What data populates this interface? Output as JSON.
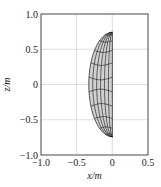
{
  "chart_data": {
    "type": "line",
    "title": "",
    "xlabel": "x/m",
    "ylabel": "z/m",
    "xlim": [
      -1.0,
      0.5
    ],
    "ylim": [
      -1.0,
      1.0
    ],
    "xticks": [
      -1.0,
      -0.5,
      0,
      0.5
    ],
    "xtick_labels": [
      "−1.0",
      "−0.5",
      "0",
      "0.5"
    ],
    "yticks": [
      -1.0,
      -0.5,
      0,
      0.5,
      1.0
    ],
    "ytick_labels": [
      "−1.0",
      "−0.5",
      "0",
      "0.5",
      "1.0"
    ],
    "grid": true,
    "surface": {
      "description": "half-ellipsoid wireframe mesh projected onto x-z plane",
      "x_range": [
        -0.33,
        0.0
      ],
      "z_range": [
        -0.74,
        0.74
      ],
      "meridians": 6,
      "parallels": 11,
      "fill_color": "#d0d0d0",
      "line_color": "#111111"
    }
  }
}
